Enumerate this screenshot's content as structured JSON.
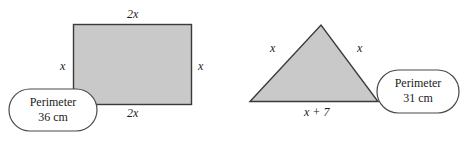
{
  "figure": {
    "colors": {
      "shape_fill": "#c9c9c9",
      "shape_stroke": "#3a3a3a",
      "callout_stroke": "#4a4a4a",
      "callout_fill": "#ffffff",
      "text": "#1a1a1a",
      "background": "#ffffff"
    },
    "shapes": [
      {
        "name": "rectangle",
        "labels": {
          "top": "2x",
          "bottom": "2x",
          "left": "x",
          "right": "x"
        },
        "callout": {
          "line1": "Perimeter",
          "line2": "36 cm"
        }
      },
      {
        "name": "triangle",
        "labels": {
          "left_side": "x",
          "right_side": "x",
          "base": "x + 7"
        },
        "callout": {
          "line1": "Perimeter",
          "line2": "31 cm"
        }
      }
    ]
  }
}
